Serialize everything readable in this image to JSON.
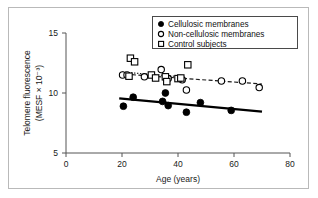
{
  "figure": {
    "background_color": "#ffffff",
    "frame_color": "#b9b9b9",
    "axis_color": "#555555"
  },
  "chart_data": {
    "type": "scatter",
    "title": "",
    "xlabel": "Age (years)",
    "ylabel": "Telomere fluorescence (MESF × 10⁻³)",
    "ylabel_line1": "Telomere fluorescence",
    "ylabel_line2": "(MESF × 10⁻³)",
    "xlim": [
      0,
      80
    ],
    "ylim": [
      5,
      15
    ],
    "xticks": [
      0,
      20,
      40,
      60,
      80
    ],
    "yticks": [
      5,
      10,
      15
    ],
    "xtick_labels": [
      "0",
      "20",
      "40",
      "60",
      "80"
    ],
    "ytick_labels": [
      "5",
      "10",
      "15"
    ],
    "grid": false,
    "legend_position": "top-right",
    "series": [
      {
        "name": "Cellulosic membranes",
        "marker": "filled-circle",
        "marker_color": "#000000",
        "trendline_style": "solid",
        "trendline": {
          "x": [
            19,
            70
          ],
          "y": [
            9.55,
            8.45
          ]
        },
        "points": [
          {
            "x": 20.5,
            "y": 8.9
          },
          {
            "x": 24.0,
            "y": 9.65
          },
          {
            "x": 34.5,
            "y": 9.3
          },
          {
            "x": 35.5,
            "y": 10.0
          },
          {
            "x": 36.5,
            "y": 8.95
          },
          {
            "x": 43.0,
            "y": 8.4
          },
          {
            "x": 48.0,
            "y": 9.2
          },
          {
            "x": 59.0,
            "y": 8.55
          }
        ]
      },
      {
        "name": "Non-cellulosic membranes",
        "marker": "open-circle",
        "marker_color": "#000000",
        "trendline_style": "dashed",
        "trendline": {
          "x": [
            19,
            70
          ],
          "y": [
            11.6,
            10.75
          ]
        },
        "points": [
          {
            "x": 20.2,
            "y": 11.5
          },
          {
            "x": 21.8,
            "y": 11.5
          },
          {
            "x": 28.0,
            "y": 11.35
          },
          {
            "x": 34.0,
            "y": 11.95
          },
          {
            "x": 36.5,
            "y": 11.2
          },
          {
            "x": 41.5,
            "y": 11.1
          },
          {
            "x": 43.0,
            "y": 10.25
          },
          {
            "x": 55.5,
            "y": 11.0
          },
          {
            "x": 63.0,
            "y": 11.0
          },
          {
            "x": 69.0,
            "y": 10.45
          }
        ]
      },
      {
        "name": "Control subjects",
        "marker": "open-square",
        "marker_color": "#000000",
        "trendline_style": "dotted",
        "trendline": {
          "x": [
            20,
            41
          ],
          "y": [
            11.75,
            11.35
          ]
        },
        "points": [
          {
            "x": 23.0,
            "y": 12.9
          },
          {
            "x": 24.5,
            "y": 12.6
          },
          {
            "x": 22.5,
            "y": 11.4
          },
          {
            "x": 30.5,
            "y": 11.5
          },
          {
            "x": 32.0,
            "y": 11.25
          },
          {
            "x": 35.5,
            "y": 11.35
          },
          {
            "x": 36.0,
            "y": 10.95
          },
          {
            "x": 40.0,
            "y": 11.2
          },
          {
            "x": 41.0,
            "y": 11.25
          },
          {
            "x": 43.5,
            "y": 12.35
          }
        ]
      }
    ]
  },
  "legend": {
    "entries": [
      {
        "label": "Cellulosic membranes",
        "marker": "filled-circle"
      },
      {
        "label": "Non-cellulosic membranes",
        "marker": "open-circle"
      },
      {
        "label": "Control subjects",
        "marker": "open-square"
      }
    ]
  }
}
